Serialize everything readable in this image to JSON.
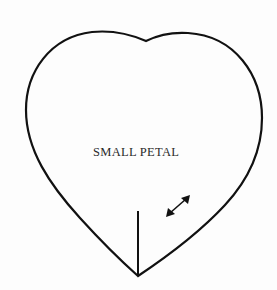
{
  "pattern_piece": {
    "label": "SMALL PETAL",
    "shape": "heart",
    "markings": {
      "slit_line": "vertical cut line from bottom point",
      "grain_arrow": "double-headed arrow"
    }
  }
}
